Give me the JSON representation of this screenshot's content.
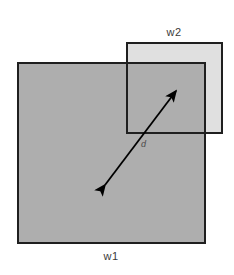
{
  "figure": {
    "canvas": {
      "width": 234,
      "height": 275,
      "background": "#ffffff"
    },
    "labels": {
      "w1": "w1",
      "w2": "w2",
      "distance": "d"
    },
    "colors": {
      "background": "#ffffff",
      "window1_fill": "#aeaeae",
      "window2_fill": "#e0e0e0",
      "overlap_fill": "#aeaeae",
      "border": "#1f1f1f",
      "arrow": "#000000",
      "label_text": "#3a3a3a"
    },
    "shapes": [
      {
        "name": "window-1",
        "label": "w1",
        "type": "rect",
        "x": 18,
        "y": 63,
        "width": 187,
        "height": 180,
        "fill": "#aeaeae",
        "stroke": "#1f1f1f",
        "stroke_width": 2
      },
      {
        "name": "window-2",
        "label": "w2",
        "type": "rect",
        "x": 127,
        "y": 43,
        "width": 95,
        "height": 90,
        "fill": "#e0e0e0",
        "stroke": "#1f1f1f",
        "stroke_width": 2
      }
    ],
    "arrow": {
      "name": "distance-arrow",
      "label": "d",
      "double_headed": true,
      "start": {
        "x": 105,
        "y": 185
      },
      "end": {
        "x": 176,
        "y": 91
      },
      "stroke": "#000000",
      "stroke_width": 2
    },
    "label_positions": {
      "w1": {
        "x": 111,
        "y": 258
      },
      "w2": {
        "x": 174,
        "y": 33
      },
      "d": {
        "x": 145,
        "y": 146
      }
    }
  }
}
